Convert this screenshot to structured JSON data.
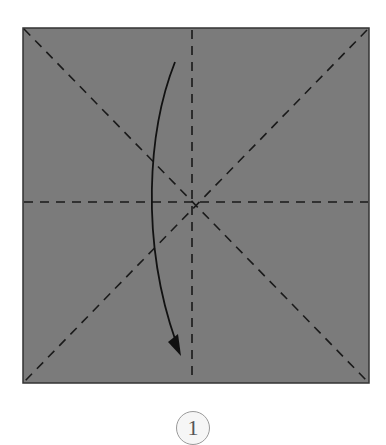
{
  "diagram": {
    "type": "origami-fold-step",
    "paper": {
      "color": "#7b7b7b",
      "edge_color": "#333333"
    },
    "crease_lines": [
      {
        "id": "vertical-center",
        "style": "dashed"
      },
      {
        "id": "horizontal-center",
        "style": "dashed"
      },
      {
        "id": "diagonal-tl-br",
        "style": "dashed"
      },
      {
        "id": "diagonal-tr-bl",
        "style": "dashed"
      }
    ],
    "arrow": {
      "direction": "fold-down",
      "style": "curved"
    },
    "step": {
      "number": "1"
    }
  }
}
